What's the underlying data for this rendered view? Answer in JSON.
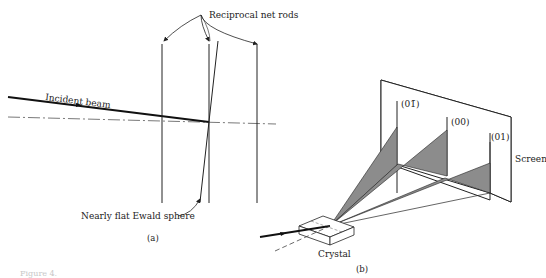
{
  "panel_a": {
    "label": "(a)",
    "incident_beam_label": "Incident beam",
    "rods_label": "Reciprocal net rods",
    "ewald_label": "Nearly flat Ewald sphere"
  },
  "panel_b": {
    "label": "(b)",
    "crystal_label": "Crystal",
    "screen_label": "Screen",
    "spots": [
      "(01̄)",
      "(00)",
      "(01)"
    ]
  },
  "caption_fragment": "Figure 4.",
  "colors": {
    "line": "#222222",
    "fan_fill": "#8c8c8c",
    "axis": "#555555"
  }
}
